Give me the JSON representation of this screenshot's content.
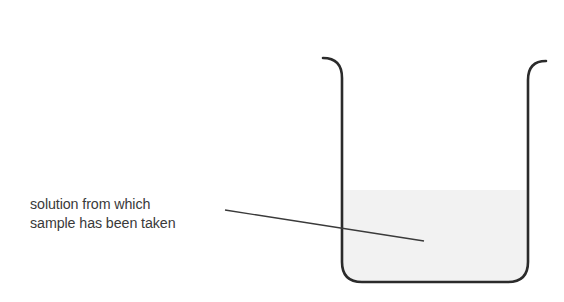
{
  "diagram": {
    "type": "beaker-illustration",
    "label": {
      "line1": "solution from which",
      "line2": "sample has been taken"
    },
    "colors": {
      "outline": "#2b2b2b",
      "liquid": "#f2f2f2",
      "leader_line": "#3a3a3a",
      "text": "#3a3a3a",
      "background": "#ffffff"
    }
  }
}
